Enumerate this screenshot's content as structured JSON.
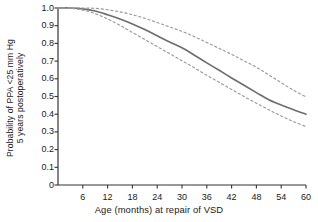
{
  "chart_data": {
    "type": "line",
    "title": "",
    "xlabel": "Age (months) at repair of VSD",
    "ylabel_line1": "Probability of PPA <25 mm Hg",
    "ylabel_line2": "5 years postoperatively",
    "xlim": [
      0,
      60
    ],
    "ylim": [
      0,
      1.0
    ],
    "grid": false,
    "legend": "none",
    "xticks": [
      6,
      12,
      18,
      24,
      30,
      36,
      42,
      48,
      54,
      60
    ],
    "xtick_labels": [
      "6",
      "12",
      "18",
      "24",
      "30",
      "36",
      "42",
      "48",
      "54",
      "60"
    ],
    "yticks": [
      0,
      0.1,
      0.2,
      0.3,
      0.4,
      0.5,
      0.6,
      0.7,
      0.8,
      0.9,
      1.0
    ],
    "ytick_labels": [
      "0",
      "0.1",
      "0.2",
      "0.3",
      "0.4",
      "0.5",
      "0.6",
      "0.7",
      "0.8",
      "0.9",
      "1.0"
    ],
    "x": [
      0,
      3,
      6,
      9,
      12,
      15,
      18,
      21,
      24,
      27,
      30,
      33,
      36,
      39,
      42,
      45,
      48,
      51,
      54,
      57,
      60
    ],
    "series": [
      {
        "name": "Predicted probability",
        "style": "solid",
        "color": "#6e6e6e",
        "values": [
          1.0,
          1.0,
          0.995,
          0.983,
          0.962,
          0.938,
          0.91,
          0.878,
          0.843,
          0.808,
          0.775,
          0.733,
          0.69,
          0.648,
          0.605,
          0.563,
          0.522,
          0.482,
          0.452,
          0.425,
          0.4
        ]
      },
      {
        "name": "Upper 70% confidence limit",
        "style": "dashed",
        "color": "#9a9a9a",
        "values": [
          1.0,
          1.0,
          1.0,
          0.998,
          0.99,
          0.978,
          0.962,
          0.942,
          0.918,
          0.893,
          0.868,
          0.838,
          0.805,
          0.772,
          0.738,
          0.702,
          0.665,
          0.622,
          0.578,
          0.535,
          0.498
        ]
      },
      {
        "name": "Lower 70% confidence limit",
        "style": "dashed",
        "color": "#9a9a9a",
        "values": [
          1.0,
          0.998,
          0.988,
          0.968,
          0.938,
          0.902,
          0.862,
          0.822,
          0.782,
          0.742,
          0.702,
          0.662,
          0.62,
          0.58,
          0.54,
          0.5,
          0.462,
          0.425,
          0.39,
          0.358,
          0.33
        ]
      }
    ],
    "axis_color": "#333333",
    "text_color": "#1a1a1a"
  }
}
